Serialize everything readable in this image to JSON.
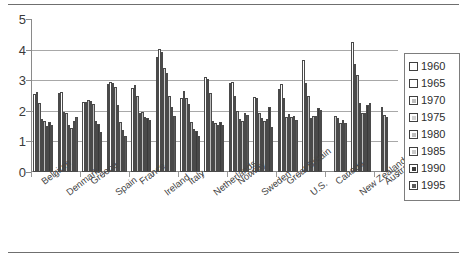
{
  "chart_data": {
    "type": "bar",
    "title": "",
    "xlabel": "",
    "ylabel": "",
    "ylim": [
      0,
      5
    ],
    "yticks": [
      0,
      1,
      2,
      3,
      4,
      5
    ],
    "grid": true,
    "legend_position": "right",
    "categories": [
      "Belgium",
      "Denmark",
      "Greece",
      "Spain",
      "France",
      "Ireland",
      "Italy",
      "Netherlands",
      "Norway",
      "Sweden",
      "Great Britain",
      "U.S.",
      "Canada",
      "New Zealand",
      "Australia"
    ],
    "series": [
      {
        "name": "1960",
        "color": "#ffffff",
        "values": [
          2.56,
          2.57,
          2.28,
          2.86,
          2.73,
          3.76,
          2.41,
          3.12,
          2.91,
          2.46,
          2.72,
          3.65,
          null,
          4.24,
          null
        ]
      },
      {
        "name": "1965",
        "color": "#ffffff",
        "values": [
          2.6,
          2.61,
          2.3,
          2.94,
          2.84,
          4.03,
          2.66,
          3.04,
          2.94,
          2.42,
          2.88,
          2.91,
          null,
          3.53,
          null
        ]
      },
      {
        "name": "1970",
        "color": "#bdbdbd",
        "values": [
          2.25,
          1.95,
          2.34,
          2.9,
          2.47,
          3.93,
          2.42,
          2.57,
          2.5,
          1.92,
          2.43,
          2.48,
          null,
          3.17,
          2.13
        ]
      },
      {
        "name": "1975",
        "color": "#cfcfcf",
        "values": [
          1.74,
          1.92,
          2.32,
          2.79,
          1.93,
          3.4,
          2.21,
          1.66,
          1.98,
          1.77,
          1.81,
          1.77,
          1.83,
          2.27,
          1.85
        ]
      },
      {
        "name": "1980",
        "color": "#bfbfbf",
        "values": [
          1.68,
          1.55,
          2.21,
          2.2,
          1.95,
          3.23,
          1.64,
          1.6,
          1.72,
          1.68,
          1.9,
          1.84,
          1.75,
          1.94,
          1.81
        ]
      },
      {
        "name": "1985",
        "color": "#c9c9c9",
        "values": [
          1.51,
          1.45,
          1.68,
          1.64,
          1.81,
          2.5,
          1.42,
          1.55,
          1.68,
          1.74,
          1.79,
          1.84,
          1.61,
          1.92,
          null
        ]
      },
      {
        "name": "1990",
        "color": "#3b3b3b",
        "values": [
          1.62,
          1.67,
          1.57,
          1.36,
          1.78,
          2.11,
          1.33,
          1.62,
          1.93,
          2.13,
          1.83,
          2.08,
          1.71,
          2.18,
          null
        ]
      },
      {
        "name": "1995",
        "color": "#5a5a5a",
        "values": [
          1.55,
          1.81,
          1.32,
          1.18,
          1.7,
          1.84,
          1.17,
          1.53,
          1.87,
          1.47,
          1.71,
          2.02,
          1.6,
          2.27,
          null
        ]
      }
    ]
  }
}
